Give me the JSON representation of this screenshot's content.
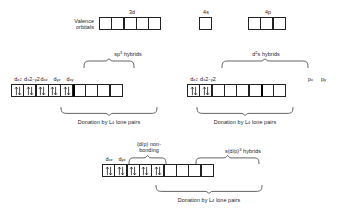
{
  "figure": {
    "title_row": {
      "valence_label_line1": "Valence",
      "valence_label_line2": "orbitals",
      "sets": [
        {
          "name": "3d",
          "boxes": 5
        },
        {
          "name": "4s",
          "boxes": 1
        },
        {
          "name": "4p",
          "boxes": 3
        }
      ]
    },
    "row2_left": {
      "orbital_labels": [
        "d",
        "d",
        "d",
        "d",
        "d"
      ],
      "orbital_subs": [
        "z2",
        "x2−y2",
        "xz",
        "yz",
        "xy"
      ],
      "orbital_text": [
        "d z2",
        "d x2−y2",
        "d xz",
        "d yz",
        "d xy"
      ],
      "filled_boxes": 5,
      "empty_boxes": 4,
      "hybrid_label": "sp",
      "hybrid_sup": "3",
      "hybrid_suffix": " hybrids",
      "donation_caption": "Donation by L",
      "donation_sub": "4",
      "donation_suffix": " lone pairs"
    },
    "row2_right": {
      "orbital_text": [
        "d z2",
        "d x2−y2"
      ],
      "filled_boxes": 2,
      "hybrid_empty_boxes": 4,
      "p_boxes": 2,
      "p_labels": [
        "p",
        "p"
      ],
      "p_subs": [
        "x",
        "y"
      ],
      "hybrid_label": "d",
      "hybrid_sup": "2",
      "hybrid_suffix": "s  hybrids",
      "donation_caption": "Donation by L",
      "donation_sub": "4",
      "donation_suffix": " lone pairs"
    },
    "row3": {
      "orbital_text": [
        "d xz",
        "d yz"
      ],
      "nonbonding_line1": "(d/p) non-",
      "nonbonding_line2": "bonding",
      "nonbonding_boxes": 3,
      "filled_boxes": 5,
      "hybrid_label": "s(d/p)",
      "hybrid_sup": "3",
      "hybrid_suffix": " hybrids",
      "hybrid_boxes": 4,
      "donation_caption": "Donation by L",
      "donation_sub": "4",
      "donation_suffix": " lone pairs"
    }
  },
  "colors": {
    "stroke": "#222222",
    "thick_divider": "#000000",
    "background": "#ffffff",
    "accent_edge": "#1c1c6e"
  }
}
